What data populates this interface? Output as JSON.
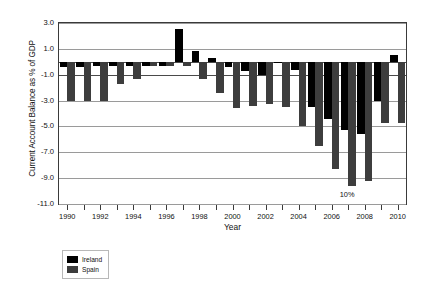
{
  "chart_data": {
    "type": "bar",
    "title": "",
    "xlabel": "Year",
    "ylabel": "Current Account Balance as % of GDP",
    "grid": true,
    "legend_position": "bottom-left",
    "xlim": [
      1989.5,
      2010.5
    ],
    "ylim": [
      -11.0,
      3.0
    ],
    "ytick_labels": [
      "3.0",
      "1.0",
      "-1.0",
      "-3.0",
      "-5.0",
      "-7.0",
      "-9.0",
      "-11.0"
    ],
    "ytick_values": [
      3.0,
      1.0,
      -1.0,
      -3.0,
      -5.0,
      -7.0,
      -9.0,
      -11.0
    ],
    "xtick_labels": [
      "1990",
      "1992",
      "1994",
      "1996",
      "1998",
      "2000",
      "2002",
      "2004",
      "2006",
      "2008",
      "2010"
    ],
    "xtick_values": [
      1990,
      1992,
      1994,
      1996,
      1998,
      2000,
      2002,
      2004,
      2006,
      2008,
      2010
    ],
    "categories": [
      1990,
      1991,
      1992,
      1993,
      1994,
      1995,
      1996,
      1997,
      1998,
      1999,
      2000,
      2001,
      2002,
      2003,
      2004,
      2005,
      2006,
      2007,
      2008,
      2009,
      2010
    ],
    "series": [
      {
        "name": "Ireland",
        "color": "#000000",
        "values": [
          -0.4,
          -0.4,
          -0.3,
          -0.3,
          -0.3,
          -0.3,
          -0.3,
          2.5,
          0.8,
          0.3,
          -0.4,
          -0.7,
          -1.0,
          0.0,
          -0.6,
          -3.5,
          -4.4,
          -5.3,
          -5.6,
          -3.0,
          0.5
        ]
      },
      {
        "name": "Spain",
        "color": "#3d3d3d",
        "values": [
          -3.0,
          -3.0,
          -3.0,
          -1.7,
          -1.3,
          -0.3,
          -0.3,
          -0.3,
          -1.3,
          -2.4,
          -3.6,
          -3.4,
          -3.3,
          -3.5,
          -5.0,
          -6.5,
          -8.3,
          -9.6,
          -9.2,
          -4.7,
          -4.7
        ]
      }
    ],
    "annotations": [
      {
        "text": "10%",
        "x": 2007,
        "y": -10.0
      }
    ]
  },
  "legend": {
    "entries": [
      {
        "label": "Ireland",
        "color": "#000000"
      },
      {
        "label": "Spain",
        "color": "#3d3d3d"
      }
    ]
  }
}
